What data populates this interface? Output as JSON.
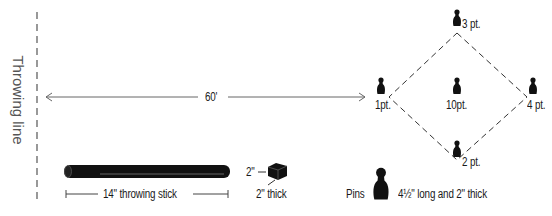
{
  "diagram": {
    "throwing_line_label": "Throwing line",
    "distance_label": "60'",
    "pins": [
      {
        "label": "3 pt.",
        "x": 457,
        "y": 20
      },
      {
        "label": "1pt.",
        "x": 381,
        "y": 90
      },
      {
        "label": "10pt.",
        "x": 457,
        "y": 90
      },
      {
        "label": "4 pt.",
        "x": 533,
        "y": 90
      },
      {
        "label": "2 pt.",
        "x": 457,
        "y": 152
      }
    ],
    "stick_label": "14\" throwing stick",
    "block": {
      "side_label": "2\"",
      "thickness_label": "2\"  thick"
    },
    "pins_legend": {
      "label": "Pins",
      "description": "4½\" long and 2\" thick"
    },
    "colors": {
      "ink": "#1a1a1a",
      "line": "#666666",
      "stick": "#111111"
    }
  }
}
